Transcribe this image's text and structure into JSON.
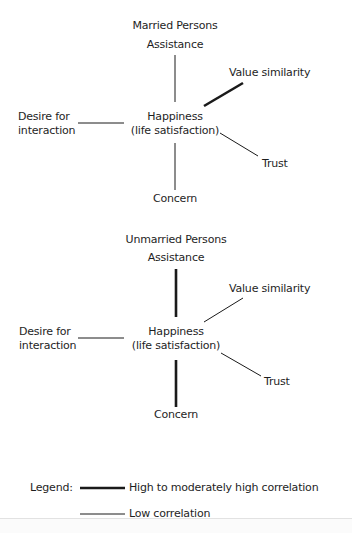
{
  "panels": [
    {
      "title": "Married Persons",
      "center_label_line1": "Happiness",
      "center_label_line2": "(life satisfaction)",
      "nodes": {
        "assistance": "Assistance",
        "value_similarity": "Value similarity",
        "desire_line1": "Desire for",
        "desire_line2": "interaction",
        "trust": "Trust",
        "concern": "Concern"
      },
      "edges": [
        {
          "to": "Assistance",
          "correlation": "low"
        },
        {
          "to": "Value similarity",
          "correlation": "high"
        },
        {
          "to": "Desire for interaction",
          "correlation": "low"
        },
        {
          "to": "Trust",
          "correlation": "low"
        },
        {
          "to": "Concern",
          "correlation": "low"
        }
      ]
    },
    {
      "title": "Unmarried Persons",
      "center_label_line1": "Happiness",
      "center_label_line2": "(life satisfaction)",
      "nodes": {
        "assistance": "Assistance",
        "value_similarity": "Value similarity",
        "desire_line1": "Desire for",
        "desire_line2": "interaction",
        "trust": "Trust",
        "concern": "Concern"
      },
      "edges": [
        {
          "to": "Assistance",
          "correlation": "high"
        },
        {
          "to": "Value similarity",
          "correlation": "low"
        },
        {
          "to": "Desire for interaction",
          "correlation": "low"
        },
        {
          "to": "Trust",
          "correlation": "low"
        },
        {
          "to": "Concern",
          "correlation": "high"
        }
      ]
    }
  ],
  "legend": {
    "prefix": "Legend:",
    "high_label": "High to moderately high correlation",
    "low_label": "Low correlation"
  },
  "colors": {
    "line": "#1a1a1a",
    "text": "#1e1e1e"
  },
  "stroke_widths": {
    "high": 2.6,
    "low": 1.0
  }
}
